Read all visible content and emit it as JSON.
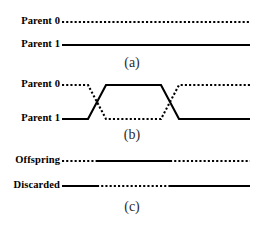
{
  "figure": {
    "width": 267,
    "height": 230,
    "background": "#ffffff",
    "ink_color": "#000000"
  },
  "panels": [
    {
      "id": "panel-a",
      "caption": "(a)",
      "caption_x": 132,
      "caption_y": 61,
      "rows": [
        {
          "label": "Parent 0",
          "label_right": 60,
          "y": 22,
          "style": "dotted",
          "segments": [
            {
              "x1": 62,
              "x2": 250,
              "style": "dotted"
            }
          ]
        },
        {
          "label": "Parent 1",
          "label_right": 60,
          "y": 45,
          "style": "solid",
          "segments": [
            {
              "x1": 62,
              "x2": 250,
              "style": "solid"
            }
          ]
        }
      ]
    },
    {
      "id": "panel-b",
      "caption": "(b)",
      "caption_x": 132,
      "caption_y": 133,
      "rows": [
        {
          "label": "Parent 0",
          "label_right": 60,
          "y": 85,
          "style": "dotted"
        },
        {
          "label": "Parent 1",
          "label_right": 60,
          "y": 119,
          "style": "solid"
        }
      ],
      "crossovers": [
        {
          "name": "crossover-point-1",
          "center_x": 97
        },
        {
          "name": "crossover-point-2",
          "center_x": 170
        }
      ],
      "geometry": {
        "top_y": 85,
        "bottom_y": 119,
        "left_x": 62,
        "right_x": 250,
        "ramp_half_width": 9
      },
      "paths": {
        "dotted_strand": "M62,85 L88,85 L106,119 L161,119 L179,85 L250,85",
        "solid_strand": "M62,119 L88,119 L106,85 L161,85 L179,119 L250,119"
      }
    },
    {
      "id": "panel-c",
      "caption": "(c)",
      "caption_x": 132,
      "caption_y": 205,
      "rows": [
        {
          "label": "Offspring",
          "label_right": 60,
          "y": 161,
          "segments": [
            {
              "x1": 62,
              "x2": 97,
              "style": "dotted"
            },
            {
              "x1": 97,
              "x2": 170,
              "style": "solid"
            },
            {
              "x1": 170,
              "x2": 250,
              "style": "dotted"
            }
          ]
        },
        {
          "label": "Discarded",
          "label_right": 60,
          "y": 186,
          "segments": [
            {
              "x1": 62,
              "x2": 97,
              "style": "solid"
            },
            {
              "x1": 97,
              "x2": 170,
              "style": "dotted"
            },
            {
              "x1": 170,
              "x2": 250,
              "style": "solid"
            }
          ]
        }
      ]
    }
  ]
}
